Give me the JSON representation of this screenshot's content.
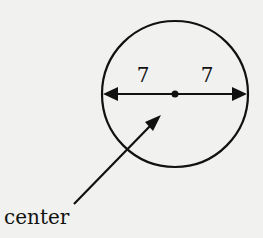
{
  "diagram": {
    "radius_left_label": "7",
    "radius_right_label": "7",
    "center_label": "center",
    "colors": {
      "background": "#f1f1ef",
      "ink": "#111111"
    }
  }
}
